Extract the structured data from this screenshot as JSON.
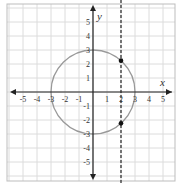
{
  "chart_data": {
    "type": "line",
    "title": "",
    "xlabel": "x",
    "ylabel": "y",
    "xlim": [
      -6,
      6
    ],
    "ylim": [
      -6,
      6
    ],
    "grid": true,
    "x_ticks": [
      -5,
      -4,
      -3,
      -2,
      -1,
      1,
      2,
      3,
      4,
      5
    ],
    "y_ticks": [
      -5,
      -4,
      -3,
      -2,
      -1,
      1,
      2,
      3,
      4,
      5
    ],
    "x_tick_labels": [
      "-5",
      "-4",
      "-3",
      "-2",
      "-1",
      "1",
      "2",
      "3",
      "4",
      "5"
    ],
    "y_tick_labels": [
      "-5",
      "-4",
      "-3",
      "-2",
      "-1",
      "1",
      "2",
      "3",
      "4",
      "5"
    ],
    "series": [
      {
        "name": "circle",
        "kind": "circle",
        "center": [
          0,
          0
        ],
        "radius": 3,
        "color": "#999999",
        "style": "solid"
      },
      {
        "name": "vertical line x=2",
        "kind": "vline",
        "x": 2,
        "color": "#333333",
        "style": "dashed"
      }
    ],
    "points": [
      {
        "x": 2,
        "y": 2.24,
        "color": "#111111"
      },
      {
        "x": 2,
        "y": -2.24,
        "color": "#111111"
      }
    ]
  }
}
